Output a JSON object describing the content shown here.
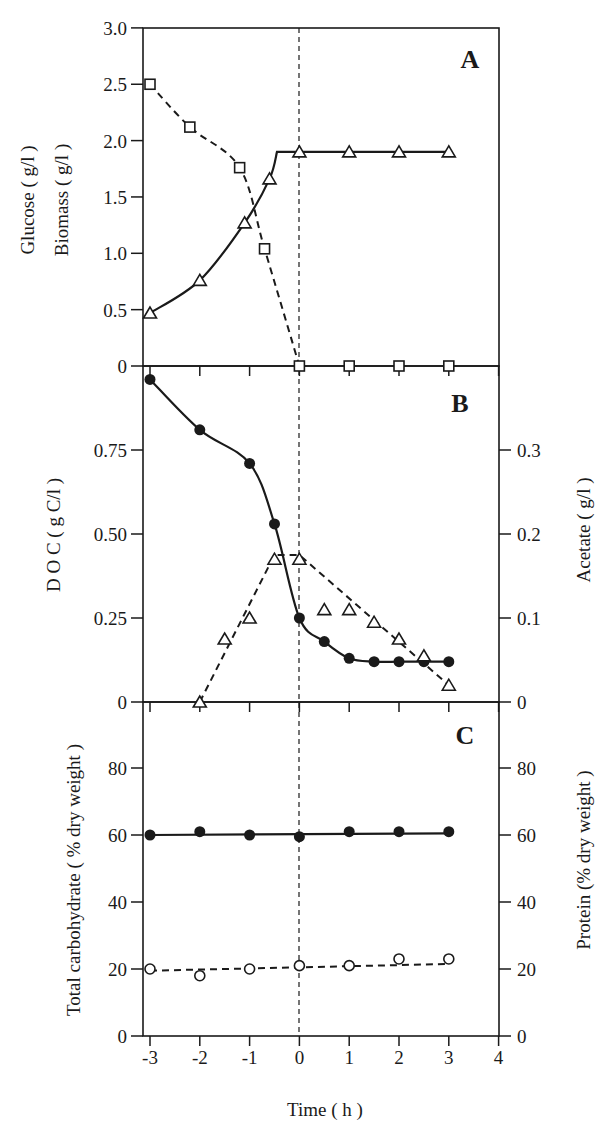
{
  "figure": {
    "x_axis": {
      "label": "Time ( h )",
      "ticks": [
        "-3",
        "-2",
        "-1",
        "0",
        "1",
        "2",
        "3",
        "4"
      ]
    },
    "panels": [
      {
        "letter": "A",
        "left_label_1": "Glucose ( g/l )",
        "left_label_2": "Biomass ( g/l )",
        "left_ticks": [
          "0",
          "0.5",
          "1.0",
          "1.5",
          "2.0",
          "2.5",
          "3.0"
        ]
      },
      {
        "letter": "B",
        "left_label": "D O C ( g C/l )",
        "right_label": "Acetate ( g/l )",
        "left_ticks": [
          "0",
          "0.25",
          "0.50",
          "0.75"
        ],
        "right_ticks": [
          "0",
          "0.1",
          "0.2",
          "0.3"
        ]
      },
      {
        "letter": "C",
        "left_label": "Total carbohydrate ( % dry weight )",
        "right_label": "Protein (% dry weight )",
        "left_ticks": [
          "0",
          "20",
          "40",
          "60",
          "80"
        ],
        "right_ticks": [
          "0",
          "20",
          "40",
          "60",
          "80"
        ]
      }
    ]
  },
  "chart_data": [
    {
      "type": "line",
      "panel": "A",
      "title": "A",
      "xlabel": "Time ( h )",
      "ylabel": "Glucose ( g/l )  Biomass ( g/l )",
      "xlim": [
        -3,
        4
      ],
      "ylim": [
        0,
        3.0
      ],
      "x_ticks": [
        -3,
        -2,
        -1,
        0,
        1,
        2,
        3,
        4
      ],
      "y_ticks": [
        0,
        0.5,
        1.0,
        1.5,
        2.0,
        2.5,
        3.0
      ],
      "grid": false,
      "vertical_reference_line": 0,
      "series": [
        {
          "name": "Glucose",
          "marker": "open-square",
          "line": "dashed",
          "x": [
            -3,
            -2.2,
            -1.2,
            -0.7,
            0,
            1,
            2,
            3
          ],
          "y": [
            2.5,
            2.12,
            1.76,
            1.04,
            0,
            0,
            0,
            0
          ]
        },
        {
          "name": "Biomass",
          "marker": "open-triangle",
          "line": "solid",
          "x": [
            -3,
            -2,
            -1.1,
            -0.6,
            0,
            1,
            2,
            3
          ],
          "y": [
            0.47,
            0.76,
            1.27,
            1.66,
            1.9,
            1.9,
            1.9,
            1.9
          ]
        }
      ]
    },
    {
      "type": "line",
      "panel": "B",
      "title": "B",
      "xlabel": "Time ( h )",
      "ylabel": "D O C ( g C/l )",
      "ylabel_right": "Acetate ( g/l )",
      "xlim": [
        -3,
        4
      ],
      "ylim": [
        0,
        1.0
      ],
      "ylim_right": [
        0,
        0.4
      ],
      "y_ticks": [
        0,
        0.25,
        0.5,
        0.75
      ],
      "y_ticks_right": [
        0,
        0.1,
        0.2,
        0.3
      ],
      "grid": false,
      "vertical_reference_line": 0,
      "series": [
        {
          "name": "DOC",
          "axis": "left",
          "marker": "filled-circle",
          "line": "solid",
          "x": [
            -3,
            -2,
            -1,
            -0.5,
            0,
            0.5,
            1,
            1.5,
            2,
            2.5,
            3
          ],
          "y": [
            0.96,
            0.81,
            0.71,
            0.53,
            0.25,
            0.18,
            0.13,
            0.12,
            0.12,
            0.12,
            0.12
          ]
        },
        {
          "name": "Acetate",
          "axis": "right",
          "marker": "open-triangle",
          "line": "dashed",
          "x": [
            -2,
            -1.5,
            -1,
            -0.5,
            0,
            0.5,
            1,
            1.5,
            2,
            2.5,
            3
          ],
          "y": [
            0.0,
            0.075,
            0.1,
            0.17,
            0.17,
            0.11,
            0.11,
            0.095,
            0.075,
            0.055,
            0.02
          ]
        }
      ]
    },
    {
      "type": "line",
      "panel": "C",
      "title": "C",
      "xlabel": "Time ( h )",
      "ylabel": "Total carbohydrate ( % dry weight )",
      "ylabel_right": "Protein (% dry weight )",
      "xlim": [
        -3,
        4
      ],
      "ylim": [
        0,
        100
      ],
      "ylim_right": [
        0,
        100
      ],
      "y_ticks": [
        0,
        20,
        40,
        60,
        80
      ],
      "y_ticks_right": [
        0,
        20,
        40,
        60,
        80
      ],
      "grid": false,
      "vertical_reference_line": 0,
      "series": [
        {
          "name": "Total carbohydrate",
          "axis": "left",
          "marker": "filled-circle",
          "line": "solid",
          "x": [
            -3,
            -2,
            -1,
            0,
            1,
            2,
            3
          ],
          "y": [
            60,
            61,
            60,
            59.5,
            61,
            61,
            61
          ]
        },
        {
          "name": "Protein",
          "axis": "right",
          "marker": "open-circle",
          "line": "dashed",
          "x": [
            -3,
            -2,
            -1,
            0,
            1,
            2,
            3
          ],
          "y": [
            20,
            18,
            20,
            21,
            21,
            23,
            23
          ]
        }
      ]
    }
  ]
}
